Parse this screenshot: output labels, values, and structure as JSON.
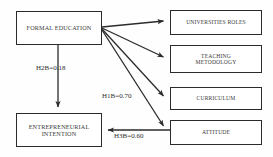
{
  "diagram": {
    "background_color": "#fefefe",
    "line_color": "#2b2b2b",
    "text_color": "#3a3a3a",
    "nodes": [
      {
        "id": "formal-education",
        "label": "FORMAL EDUCATION"
      },
      {
        "id": "entrepreneurial-intention",
        "label": "ENTREPRENEURIAL\nINTENTION"
      },
      {
        "id": "universities-roles",
        "label": "UNIVERSITIES ROLES"
      },
      {
        "id": "teaching-metodology",
        "label": "TEACHING\nMETODOLOGY"
      },
      {
        "id": "curriculum",
        "label": "CURRICULUM"
      },
      {
        "id": "attitude",
        "label": "ATTITUDE"
      }
    ],
    "edges": [
      {
        "id": "fe-to-universities-roles",
        "from": "formal-education",
        "to": "universities-roles",
        "label": ""
      },
      {
        "id": "fe-to-teaching-metodology",
        "from": "formal-education",
        "to": "teaching-metodology",
        "label": ""
      },
      {
        "id": "fe-to-curriculum",
        "from": "formal-education",
        "to": "curriculum",
        "label": ""
      },
      {
        "id": "fe-to-attitude",
        "from": "formal-education",
        "to": "attitude",
        "label": "H1B=0.70"
      },
      {
        "id": "fe-to-entrepreneurial-intention",
        "from": "formal-education",
        "to": "entrepreneurial-intention",
        "label": "H2B=0.18"
      },
      {
        "id": "attitude-to-entrepreneurial-intention",
        "from": "attitude",
        "to": "entrepreneurial-intention",
        "label": "H3B=0.60"
      }
    ],
    "labels": {
      "h2b": "H2B=0.18",
      "h1b": "H1B=0.70",
      "h3b": "H3B=0.60"
    }
  }
}
